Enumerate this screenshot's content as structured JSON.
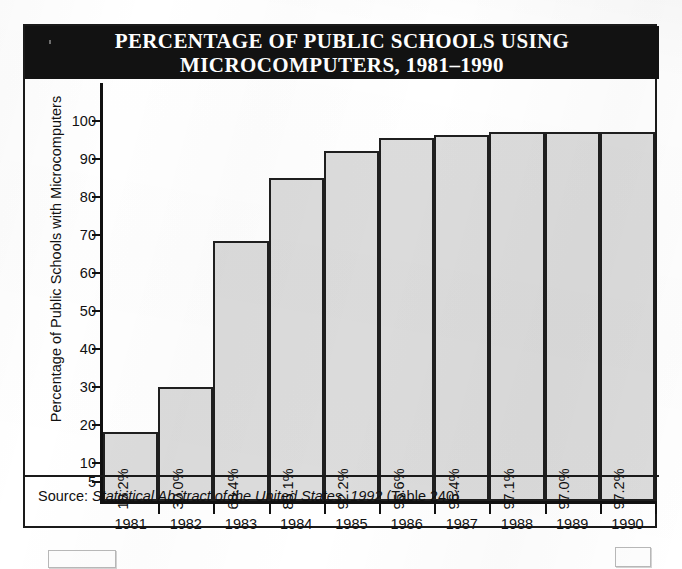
{
  "figure": {
    "title_line1": "PERCENTAGE OF PUBLIC SCHOOLS USING",
    "title_line2": "MICROCOMPUTERS, 1981–1990",
    "source_prefix": "Source: ",
    "source_italic": "Statistical Abstract of the United States, 1992",
    "source_suffix": " (Table 240)"
  },
  "chart_data": {
    "type": "bar",
    "title": "PERCENTAGE OF PUBLIC SCHOOLS USING MICROCOMPUTERS, 1981–1990",
    "xlabel": "",
    "ylabel": "Percentage of Public Schools with Microcomputers",
    "categories": [
      "1981",
      "1982",
      "1983",
      "1984",
      "1985",
      "1986",
      "1987",
      "1988",
      "1989",
      "1990"
    ],
    "values": [
      18.2,
      30.0,
      68.4,
      85.1,
      92.2,
      95.6,
      96.4,
      97.1,
      97.0,
      97.2
    ],
    "value_labels": [
      "18.2%",
      "30.0%",
      "68.4%",
      "85.1%",
      "92.2%",
      "95.6%",
      "96.4%",
      "97.1%",
      "97.0%",
      "97.2%"
    ],
    "ylim": [
      0,
      100
    ],
    "ytick_labels": [
      "100",
      "90",
      "80",
      "70",
      "60",
      "50",
      "40",
      "30",
      "20",
      "10",
      "5"
    ],
    "ytick_values": [
      100,
      90,
      80,
      70,
      60,
      50,
      40,
      30,
      20,
      10,
      5
    ],
    "grid": false,
    "legend": "none",
    "bar_fill_color": "#dcdcdc",
    "bar_border_color": "#1f1f1f",
    "title_bar_color": "#121212",
    "axis_color": "#111111"
  }
}
